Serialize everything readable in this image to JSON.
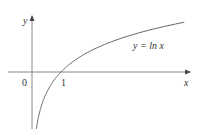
{
  "chart_data": {
    "type": "line",
    "title": "",
    "xlabel": "x",
    "ylabel": "y",
    "origin_label": "0",
    "x_ticks": [
      {
        "value": 1,
        "label": "1"
      }
    ],
    "annotation": "y = ln x",
    "function": "ln(x)",
    "xlim": [
      -0.85,
      5.4
    ],
    "ylim": [
      -1.9,
      1.85
    ],
    "grid": false,
    "legend": "none",
    "series": [
      {
        "name": "y = ln x",
        "x": [
          0.25,
          0.5,
          1,
          1.5,
          2,
          3,
          4,
          5.25
        ],
        "values": [
          -1.39,
          -0.69,
          0,
          0.41,
          0.69,
          1.1,
          1.39,
          1.66
        ]
      }
    ]
  },
  "colors": {
    "axis": "#777777",
    "curve": "#666666",
    "text": "#333333"
  }
}
